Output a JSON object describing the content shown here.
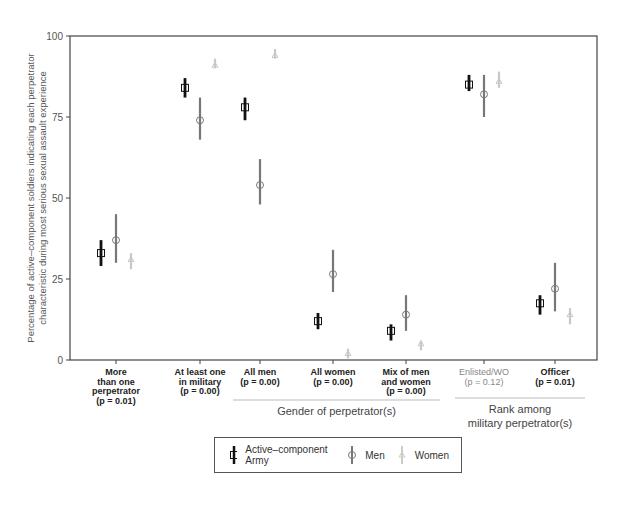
{
  "chart_data": {
    "type": "scatter",
    "subtype": "point-with-error-bars",
    "title": "",
    "xlabel": "",
    "ylabel": "Percentage of active-component soldiers indicating each perpetrator characteristic during most serious sexual assault experience",
    "ylabel_lines": [
      "Percentage of active–component soldiers indicating each perpetrator",
      "characteristic during most serious sexual assault experience"
    ],
    "ylim": [
      0,
      100
    ],
    "yticks": [
      0,
      25,
      50,
      75,
      100
    ],
    "grid": false,
    "legend_position": "bottom",
    "categories": [
      {
        "lines": [
          "More",
          "than one",
          "perpetrator",
          "(p = 0.01)"
        ],
        "significant": true
      },
      {
        "lines": [
          "At least one",
          "in military",
          "(p = 0.00)"
        ],
        "significant": true
      },
      {
        "lines": [
          "All men",
          "(p = 0.00)"
        ],
        "significant": true
      },
      {
        "lines": [
          "All women",
          "(p = 0.00)"
        ],
        "significant": true
      },
      {
        "lines": [
          "Mix of men",
          "and women",
          "(p = 0.00)"
        ],
        "significant": true
      },
      {
        "lines": [
          "Enlisted/WO",
          "(p = 0.12)"
        ],
        "significant": false
      },
      {
        "lines": [
          "Officer",
          "(p = 0.01)"
        ],
        "significant": true
      }
    ],
    "category_names": [
      "More than one perpetrator",
      "At least one in military",
      "All men",
      "All women",
      "Mix of men and women",
      "Enlisted/WO",
      "Officer"
    ],
    "p_values": [
      0.01,
      0.0,
      0.0,
      0.0,
      0.0,
      0.12,
      0.01
    ],
    "groups": [
      {
        "label_lines": [
          "Gender of perpetrator(s)"
        ],
        "categories": [
          2,
          3,
          4
        ]
      },
      {
        "label_lines": [
          "Rank among",
          "military perpetrator(s)"
        ],
        "categories": [
          5,
          6
        ]
      }
    ],
    "series": [
      {
        "name": "Active–component Army",
        "marker": "square",
        "color": "#111111",
        "values": [
          33,
          84,
          78,
          12,
          9,
          85,
          17.5
        ],
        "ci_low": [
          29,
          81,
          74,
          9.5,
          6,
          83,
          14
        ],
        "ci_high": [
          37,
          87,
          81,
          14.5,
          11,
          88,
          20
        ]
      },
      {
        "name": "Men",
        "marker": "circle",
        "color": "#777777",
        "values": [
          37,
          74,
          54,
          26.5,
          14,
          82,
          22
        ],
        "ci_low": [
          30,
          68,
          48,
          21,
          9,
          75,
          15
        ],
        "ci_high": [
          45,
          81,
          62,
          34,
          20,
          88,
          30
        ]
      },
      {
        "name": "Women",
        "marker": "triangle",
        "color": "#c8c8c8",
        "values": [
          31,
          91,
          94,
          2,
          5,
          86,
          14
        ],
        "ci_low": [
          28,
          90,
          93,
          0.5,
          3,
          84,
          11
        ],
        "ci_high": [
          33,
          93,
          96,
          3.5,
          6,
          89,
          16
        ]
      }
    ]
  },
  "legend": {
    "items": [
      {
        "label": "Active–component Army"
      },
      {
        "label": "Men"
      },
      {
        "label": "Women"
      }
    ]
  }
}
